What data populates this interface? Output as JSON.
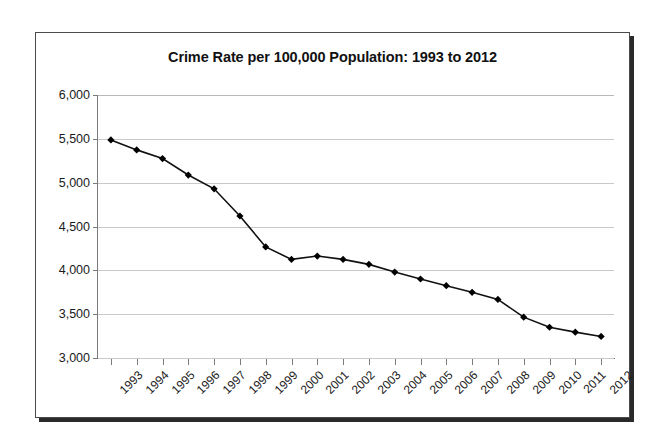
{
  "figure": {
    "title": "Crime Rate per 100,000 Population: 1993 to 2012",
    "background_color": "#ffffff",
    "border_color": "#4a4a4a",
    "shadow_color": "#2a2a2a"
  },
  "chart_data": {
    "type": "line",
    "title": "Crime Rate per 100,000 Population: 1993 to 2012",
    "xlabel": "",
    "ylabel": "",
    "grid": true,
    "legend": false,
    "marker": "diamond",
    "line_color": "#111111",
    "marker_color": "#000000",
    "gridline_color": "#c9c9c9",
    "xlim": [
      "1993",
      "2012"
    ],
    "ylim": [
      3000,
      6000
    ],
    "ytick_labels": [
      "6,000",
      "5,500",
      "5,000",
      "4,500",
      "4,000",
      "3,500",
      "3,000"
    ],
    "ytick_values": [
      6000,
      5500,
      5000,
      4500,
      4000,
      3500,
      3000
    ],
    "categories": [
      "1993",
      "1994",
      "1995",
      "1996",
      "1997",
      "1998",
      "1999",
      "2000",
      "2001",
      "2002",
      "2003",
      "2004",
      "2005",
      "2006",
      "2007",
      "2008",
      "2009",
      "2010",
      "2011",
      "2012"
    ],
    "values": [
      5487,
      5374,
      5275,
      5087,
      4930,
      4620,
      4267,
      4125,
      4163,
      4125,
      4068,
      3980,
      3901,
      3825,
      3749,
      3668,
      3466,
      3351,
      3295,
      3246
    ]
  }
}
